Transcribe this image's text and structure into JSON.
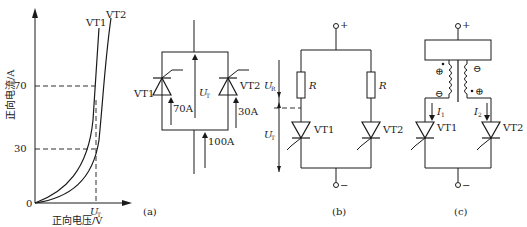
{
  "figure_a_graph": {
    "y_axis_label": "正向电流/A",
    "x_axis_label": "正向电压/V",
    "origin": "0",
    "y_ticks": [
      "70",
      "30"
    ],
    "x_marker": "U",
    "x_marker_sub": "T",
    "curves": [
      "VT1",
      "VT2"
    ]
  },
  "figure_a_circuit": {
    "caption": "(a)",
    "thyristor_left": "VT1",
    "thyristor_right": "VT2",
    "current_left": "70A",
    "current_right": "30A",
    "current_total": "100A",
    "voltage": "U",
    "voltage_sub": "T"
  },
  "figure_b": {
    "caption": "(b)",
    "terminal_top": "+",
    "terminal_bottom": "−",
    "resistor_left": "R",
    "resistor_right": "R",
    "thyristor_left": "VT1",
    "thyristor_right": "VT2",
    "voltage_r": "U",
    "voltage_r_sub": "R",
    "voltage_t": "U",
    "voltage_t_sub": "T"
  },
  "figure_c": {
    "caption": "(c)",
    "terminal_top": "+",
    "terminal_bottom": "−",
    "current_left": "I",
    "current_left_sub": "1",
    "current_right": "I",
    "current_right_sub": "2",
    "thyristor_left": "VT1",
    "thyristor_right": "VT2",
    "polarity_plus": "⊕",
    "polarity_minus": "⊖"
  }
}
